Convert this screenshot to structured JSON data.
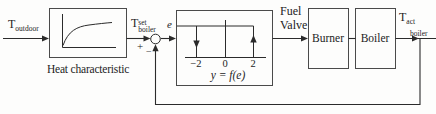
{
  "diagram": {
    "signals": {
      "t_outdoor": {
        "base": "T",
        "sub": "outdoor"
      },
      "t_set_boiler": {
        "base": "T",
        "sup": "set",
        "sub": "boiler"
      },
      "error": "e",
      "plus": "+",
      "minus": "−",
      "fuel_valve_line1": "Fuel",
      "fuel_valve_line2": "Valve",
      "t_act_boiler": {
        "base": "T",
        "sub": "act",
        "sub2": "boiler"
      }
    },
    "blocks": {
      "heat_characteristic": {
        "label": "Heat characteristic"
      },
      "relay": {
        "ticks": [
          "−2",
          "0",
          "2"
        ],
        "function_label": "y = f(e)"
      },
      "burner": {
        "label": "Burner"
      },
      "boiler": {
        "label": "Boiler"
      }
    },
    "colors": {
      "line": "#2b2b2b",
      "box_stroke": "#4a4a4a",
      "background": "#fdfdfc"
    }
  }
}
